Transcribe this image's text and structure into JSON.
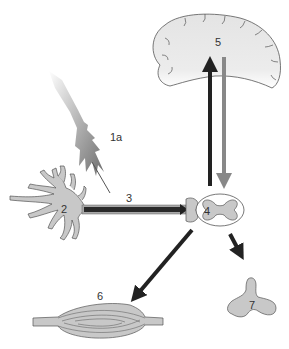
{
  "diagram": {
    "labels": {
      "receptor": "1a",
      "neuron_body": "2",
      "axon": "3",
      "spinal_cord": "4",
      "brain": "5",
      "muscle": "6",
      "gland": "7"
    },
    "colors": {
      "tissue_fill": "#c8c8c8",
      "brain_fill": "#e8e8e8",
      "outline": "#555555",
      "arrow_dark": "#222222",
      "arrow_gray": "#888888",
      "axon_sheath": "#a8a8a8"
    }
  }
}
